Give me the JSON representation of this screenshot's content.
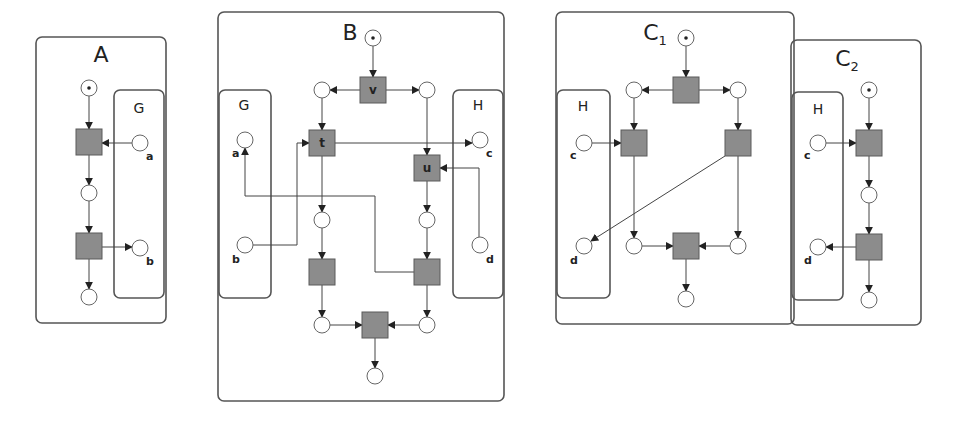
{
  "diagram": {
    "width": 956,
    "height": 425,
    "colors": {
      "box_stroke": "#555555",
      "transition_fill": "#8c8c8c",
      "place_fill": "#ffffff",
      "arc": "#444444"
    },
    "boxes": [
      {
        "id": "A",
        "x": 36,
        "y": 37,
        "w": 130,
        "h": 286,
        "title": "A",
        "sub": "",
        "tx": 101,
        "ty": 62
      },
      {
        "id": "A-G",
        "x": 114,
        "y": 90,
        "w": 50,
        "h": 208,
        "title": "G",
        "sub": "",
        "tx": 139,
        "ty": 113,
        "iface": true
      },
      {
        "id": "B",
        "x": 218,
        "y": 12,
        "w": 286,
        "h": 389,
        "title": "B",
        "sub": "",
        "tx": 350,
        "ty": 40
      },
      {
        "id": "B-G",
        "x": 219,
        "y": 90,
        "w": 52,
        "h": 208,
        "title": "G",
        "sub": "",
        "tx": 244,
        "ty": 110,
        "iface": true
      },
      {
        "id": "B-H",
        "x": 453,
        "y": 90,
        "w": 50,
        "h": 208,
        "title": "H",
        "sub": "",
        "tx": 478,
        "ty": 110,
        "iface": true
      },
      {
        "id": "C1",
        "x": 556,
        "y": 12,
        "w": 238,
        "h": 312,
        "title": "C",
        "sub": "1",
        "tx": 655,
        "ty": 40
      },
      {
        "id": "C1-H",
        "x": 557,
        "y": 90,
        "w": 53,
        "h": 208,
        "title": "H",
        "sub": "",
        "tx": 583,
        "ty": 111,
        "iface": true
      },
      {
        "id": "C2",
        "x": 791,
        "y": 40,
        "w": 130,
        "h": 285,
        "title": "C",
        "sub": "2",
        "tx": 847,
        "ty": 66
      },
      {
        "id": "C2-H",
        "x": 792,
        "y": 92,
        "w": 51,
        "h": 208,
        "title": "H",
        "sub": "",
        "tx": 818,
        "ty": 114,
        "iface": true
      }
    ],
    "places": [
      {
        "id": "A-p0",
        "cx": 89,
        "cy": 88,
        "token": true,
        "label": ""
      },
      {
        "id": "A-a",
        "cx": 140,
        "cy": 143,
        "token": false,
        "label": "a",
        "lx": 146,
        "ly": 160
      },
      {
        "id": "A-p1",
        "cx": 89,
        "cy": 193,
        "token": false,
        "label": ""
      },
      {
        "id": "A-b",
        "cx": 140,
        "cy": 248,
        "token": false,
        "label": "b",
        "lx": 146,
        "ly": 265
      },
      {
        "id": "A-p2",
        "cx": 89,
        "cy": 297,
        "token": false,
        "label": ""
      },
      {
        "id": "B-p0",
        "cx": 373,
        "cy": 38,
        "token": true,
        "label": ""
      },
      {
        "id": "B-pl",
        "cx": 322,
        "cy": 90,
        "token": false,
        "label": ""
      },
      {
        "id": "B-pr",
        "cx": 427,
        "cy": 90,
        "token": false,
        "label": ""
      },
      {
        "id": "B-a",
        "cx": 245,
        "cy": 140,
        "token": false,
        "label": "a",
        "lx": 232,
        "ly": 157
      },
      {
        "id": "B-c",
        "cx": 480,
        "cy": 140,
        "token": false,
        "label": "c",
        "lx": 486,
        "ly": 157
      },
      {
        "id": "B-p3",
        "cx": 322,
        "cy": 220,
        "token": false,
        "label": ""
      },
      {
        "id": "B-p4",
        "cx": 427,
        "cy": 220,
        "token": false,
        "label": ""
      },
      {
        "id": "B-b",
        "cx": 245,
        "cy": 245,
        "token": false,
        "label": "b",
        "lx": 232,
        "ly": 263
      },
      {
        "id": "B-d",
        "cx": 480,
        "cy": 245,
        "token": false,
        "label": "d",
        "lx": 486,
        "ly": 263
      },
      {
        "id": "B-p5",
        "cx": 322,
        "cy": 325,
        "token": false,
        "label": ""
      },
      {
        "id": "B-p6",
        "cx": 427,
        "cy": 325,
        "token": false,
        "label": ""
      },
      {
        "id": "B-p7",
        "cx": 375,
        "cy": 376,
        "token": false,
        "label": ""
      },
      {
        "id": "C1-p0",
        "cx": 686,
        "cy": 38,
        "token": true,
        "label": ""
      },
      {
        "id": "C1-pl",
        "cx": 634,
        "cy": 90,
        "token": false,
        "label": ""
      },
      {
        "id": "C1-pr",
        "cx": 738,
        "cy": 90,
        "token": false,
        "label": ""
      },
      {
        "id": "C1-c",
        "cx": 584,
        "cy": 143,
        "token": false,
        "label": "c",
        "lx": 570,
        "ly": 159
      },
      {
        "id": "C1-d",
        "cx": 584,
        "cy": 246,
        "token": false,
        "label": "d",
        "lx": 570,
        "ly": 264
      },
      {
        "id": "C1-p3",
        "cx": 634,
        "cy": 246,
        "token": false,
        "label": ""
      },
      {
        "id": "C1-p4",
        "cx": 738,
        "cy": 246,
        "token": false,
        "label": ""
      },
      {
        "id": "C1-p5",
        "cx": 686,
        "cy": 299,
        "token": false,
        "label": ""
      },
      {
        "id": "C2-p0",
        "cx": 869,
        "cy": 90,
        "token": true,
        "label": ""
      },
      {
        "id": "C2-c",
        "cx": 818,
        "cy": 143,
        "token": false,
        "label": "c",
        "lx": 804,
        "ly": 159
      },
      {
        "id": "C2-p1",
        "cx": 869,
        "cy": 195,
        "token": false,
        "label": ""
      },
      {
        "id": "C2-d",
        "cx": 818,
        "cy": 247,
        "token": false,
        "label": "d",
        "lx": 804,
        "ly": 264
      },
      {
        "id": "C2-p2",
        "cx": 869,
        "cy": 300,
        "token": false,
        "label": ""
      }
    ],
    "transitions": [
      {
        "id": "A-t1",
        "cx": 89,
        "cy": 142,
        "label": ""
      },
      {
        "id": "A-t2",
        "cx": 89,
        "cy": 246,
        "label": ""
      },
      {
        "id": "B-v",
        "cx": 373,
        "cy": 90,
        "label": "v"
      },
      {
        "id": "B-t",
        "cx": 322,
        "cy": 143,
        "label": "t"
      },
      {
        "id": "B-u",
        "cx": 427,
        "cy": 168,
        "label": "u"
      },
      {
        "id": "B-t3",
        "cx": 322,
        "cy": 272,
        "label": ""
      },
      {
        "id": "B-t4",
        "cx": 427,
        "cy": 272,
        "label": ""
      },
      {
        "id": "B-t5",
        "cx": 375,
        "cy": 325,
        "label": ""
      },
      {
        "id": "C1-t0",
        "cx": 686,
        "cy": 90,
        "label": ""
      },
      {
        "id": "C1-t1",
        "cx": 634,
        "cy": 143,
        "label": ""
      },
      {
        "id": "C1-t2",
        "cx": 738,
        "cy": 143,
        "label": ""
      },
      {
        "id": "C1-t3",
        "cx": 686,
        "cy": 246,
        "label": ""
      },
      {
        "id": "C2-t1",
        "cx": 869,
        "cy": 143,
        "label": ""
      },
      {
        "id": "C2-t2",
        "cx": 869,
        "cy": 247,
        "label": ""
      }
    ],
    "arcs": [
      {
        "id": "A-1",
        "pts": [
          [
            89,
            96
          ],
          [
            89,
            129
          ]
        ]
      },
      {
        "id": "A-2",
        "pts": [
          [
            132,
            143
          ],
          [
            102,
            143
          ]
        ]
      },
      {
        "id": "A-3",
        "pts": [
          [
            89,
            155
          ],
          [
            89,
            185
          ]
        ]
      },
      {
        "id": "A-4",
        "pts": [
          [
            89,
            201
          ],
          [
            89,
            233
          ]
        ]
      },
      {
        "id": "A-5",
        "pts": [
          [
            102,
            247
          ],
          [
            132,
            247
          ]
        ]
      },
      {
        "id": "A-6",
        "pts": [
          [
            89,
            259
          ],
          [
            89,
            289
          ]
        ]
      },
      {
        "id": "B-1",
        "pts": [
          [
            373,
            46
          ],
          [
            373,
            77
          ]
        ]
      },
      {
        "id": "B-2",
        "pts": [
          [
            360,
            90
          ],
          [
            330,
            90
          ]
        ]
      },
      {
        "id": "B-3",
        "pts": [
          [
            386,
            90
          ],
          [
            419,
            90
          ]
        ]
      },
      {
        "id": "B-4",
        "pts": [
          [
            322,
            98
          ],
          [
            322,
            130
          ]
        ]
      },
      {
        "id": "B-5",
        "pts": [
          [
            335,
            143
          ],
          [
            472,
            143
          ]
        ]
      },
      {
        "id": "B-6",
        "pts": [
          [
            427,
            98
          ],
          [
            427,
            155
          ]
        ]
      },
      {
        "id": "B-7",
        "pts": [
          [
            479,
            237
          ],
          [
            479,
            168
          ],
          [
            440,
            168
          ]
        ]
      },
      {
        "id": "B-8",
        "pts": [
          [
            253,
            245
          ],
          [
            297,
            245
          ],
          [
            297,
            143
          ],
          [
            309,
            143
          ]
        ]
      },
      {
        "id": "B-9",
        "pts": [
          [
            322,
            156
          ],
          [
            322,
            212
          ]
        ]
      },
      {
        "id": "B-10",
        "pts": [
          [
            427,
            181
          ],
          [
            427,
            212
          ]
        ]
      },
      {
        "id": "B-11",
        "pts": [
          [
            414,
            272
          ],
          [
            375,
            272
          ],
          [
            375,
            196
          ],
          [
            245,
            196
          ],
          [
            245,
            148
          ]
        ]
      },
      {
        "id": "B-12",
        "pts": [
          [
            322,
            228
          ],
          [
            322,
            259
          ]
        ]
      },
      {
        "id": "B-13",
        "pts": [
          [
            427,
            228
          ],
          [
            427,
            259
          ]
        ]
      },
      {
        "id": "B-14",
        "pts": [
          [
            322,
            285
          ],
          [
            322,
            317
          ]
        ]
      },
      {
        "id": "B-15",
        "pts": [
          [
            427,
            285
          ],
          [
            427,
            317
          ]
        ]
      },
      {
        "id": "B-16",
        "pts": [
          [
            330,
            325
          ],
          [
            362,
            325
          ]
        ]
      },
      {
        "id": "B-17",
        "pts": [
          [
            419,
            325
          ],
          [
            388,
            325
          ]
        ]
      },
      {
        "id": "B-18",
        "pts": [
          [
            375,
            338
          ],
          [
            375,
            368
          ]
        ]
      },
      {
        "id": "C1-1",
        "pts": [
          [
            686,
            46
          ],
          [
            686,
            77
          ]
        ]
      },
      {
        "id": "C1-2",
        "pts": [
          [
            673,
            90
          ],
          [
            642,
            90
          ]
        ]
      },
      {
        "id": "C1-3",
        "pts": [
          [
            699,
            90
          ],
          [
            730,
            90
          ]
        ]
      },
      {
        "id": "C1-4",
        "pts": [
          [
            634,
            98
          ],
          [
            634,
            130
          ]
        ]
      },
      {
        "id": "C1-5",
        "pts": [
          [
            738,
            98
          ],
          [
            738,
            130
          ]
        ]
      },
      {
        "id": "C1-6",
        "pts": [
          [
            592,
            143
          ],
          [
            621,
            143
          ]
        ]
      },
      {
        "id": "C1-7",
        "pts": [
          [
            725,
            156
          ],
          [
            591,
            241
          ]
        ]
      },
      {
        "id": "C1-8",
        "pts": [
          [
            634,
            156
          ],
          [
            634,
            238
          ]
        ]
      },
      {
        "id": "C1-9",
        "pts": [
          [
            738,
            156
          ],
          [
            738,
            238
          ]
        ]
      },
      {
        "id": "C1-10",
        "pts": [
          [
            642,
            246
          ],
          [
            673,
            246
          ]
        ]
      },
      {
        "id": "C1-11",
        "pts": [
          [
            730,
            246
          ],
          [
            699,
            246
          ]
        ]
      },
      {
        "id": "C1-12",
        "pts": [
          [
            686,
            259
          ],
          [
            686,
            291
          ]
        ]
      },
      {
        "id": "C2-1",
        "pts": [
          [
            869,
            98
          ],
          [
            869,
            130
          ]
        ]
      },
      {
        "id": "C2-2",
        "pts": [
          [
            826,
            143
          ],
          [
            856,
            143
          ]
        ]
      },
      {
        "id": "C2-3",
        "pts": [
          [
            869,
            156
          ],
          [
            869,
            187
          ]
        ]
      },
      {
        "id": "C2-4",
        "pts": [
          [
            869,
            203
          ],
          [
            869,
            234
          ]
        ]
      },
      {
        "id": "C2-5",
        "pts": [
          [
            856,
            247
          ],
          [
            826,
            247
          ]
        ]
      },
      {
        "id": "C2-6",
        "pts": [
          [
            869,
            260
          ],
          [
            869,
            292
          ]
        ]
      }
    ],
    "place_radius": 8,
    "transition_size": 26
  }
}
